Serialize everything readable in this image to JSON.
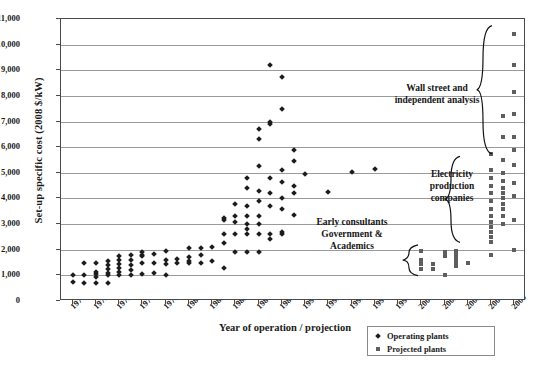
{
  "chart_data": {
    "type": "scatter",
    "title": "",
    "xlabel": "Year of operation / projection",
    "ylabel": "Set-up specific cost (2008 $/kW)",
    "xlim": [
      1970,
      2010
    ],
    "ylim": [
      0,
      11000
    ],
    "grid": true,
    "xticks": [
      1971,
      1973,
      1975,
      1977,
      1979,
      1981,
      1983,
      1985,
      1987,
      1989,
      1991,
      1993,
      1995,
      1997,
      1999,
      2001,
      2003,
      2005,
      2007,
      2009
    ],
    "yticks": [
      0,
      1000,
      2000,
      3000,
      4000,
      5000,
      6000,
      7000,
      8000,
      9000,
      10000,
      11000
    ],
    "ytick_labels": [
      "0",
      "1,000",
      "2,000",
      "3,000",
      "4,000",
      "5,000",
      "6,000",
      "7,000",
      "8,000",
      "9,000",
      "10,000",
      "11,000"
    ],
    "legend_position": "bottom-right",
    "series": [
      {
        "name": "Operating plants",
        "marker": "diamond",
        "color": "#1c1c1c",
        "points": [
          [
            1971,
            750
          ],
          [
            1971,
            1000
          ],
          [
            1972,
            700
          ],
          [
            1972,
            1000
          ],
          [
            1972,
            1500
          ],
          [
            1973,
            700
          ],
          [
            1973,
            950
          ],
          [
            1973,
            1050
          ],
          [
            1973,
            1150
          ],
          [
            1973,
            1500
          ],
          [
            1974,
            720
          ],
          [
            1974,
            1000
          ],
          [
            1974,
            1100
          ],
          [
            1974,
            1250
          ],
          [
            1974,
            1400
          ],
          [
            1974,
            1550
          ],
          [
            1975,
            1000
          ],
          [
            1975,
            1150
          ],
          [
            1975,
            1300
          ],
          [
            1975,
            1450
          ],
          [
            1975,
            1600
          ],
          [
            1975,
            1750
          ],
          [
            1976,
            1000
          ],
          [
            1976,
            1200
          ],
          [
            1976,
            1400
          ],
          [
            1976,
            1600
          ],
          [
            1976,
            1800
          ],
          [
            1977,
            1050
          ],
          [
            1977,
            1500
          ],
          [
            1977,
            1750
          ],
          [
            1977,
            1800
          ],
          [
            1977,
            1900
          ],
          [
            1978,
            1100
          ],
          [
            1978,
            1500
          ],
          [
            1978,
            1850
          ],
          [
            1979,
            1000
          ],
          [
            1979,
            1450
          ],
          [
            1979,
            1600
          ],
          [
            1979,
            1950
          ],
          [
            1980,
            1500
          ],
          [
            1980,
            1650
          ],
          [
            1981,
            1500
          ],
          [
            1981,
            1550
          ],
          [
            1981,
            1700
          ],
          [
            1981,
            2050
          ],
          [
            1982,
            1500
          ],
          [
            1982,
            1800
          ],
          [
            1982,
            2050
          ],
          [
            1983,
            1550
          ],
          [
            1983,
            2100
          ],
          [
            1984,
            1300
          ],
          [
            1984,
            2250
          ],
          [
            1984,
            2600
          ],
          [
            1984,
            3150
          ],
          [
            1984,
            3250
          ],
          [
            1985,
            1900
          ],
          [
            1985,
            2600
          ],
          [
            1985,
            3100
          ],
          [
            1985,
            3300
          ],
          [
            1985,
            3800
          ],
          [
            1986,
            1900
          ],
          [
            1986,
            2600
          ],
          [
            1986,
            2800
          ],
          [
            1986,
            3000
          ],
          [
            1986,
            3300
          ],
          [
            1986,
            3700
          ],
          [
            1986,
            4400
          ],
          [
            1986,
            4800
          ],
          [
            1987,
            1900
          ],
          [
            1987,
            2600
          ],
          [
            1987,
            3000
          ],
          [
            1987,
            3300
          ],
          [
            1987,
            3900
          ],
          [
            1987,
            4300
          ],
          [
            1987,
            5250
          ],
          [
            1987,
            6300
          ],
          [
            1987,
            6700
          ],
          [
            1988,
            2400
          ],
          [
            1988,
            2600
          ],
          [
            1988,
            3700
          ],
          [
            1988,
            4200
          ],
          [
            1988,
            4800
          ],
          [
            1988,
            6900
          ],
          [
            1988,
            7000
          ],
          [
            1988,
            9200
          ],
          [
            1989,
            2600
          ],
          [
            1989,
            2700
          ],
          [
            1989,
            3600
          ],
          [
            1989,
            4000
          ],
          [
            1989,
            4650
          ],
          [
            1989,
            5100
          ],
          [
            1989,
            7500
          ],
          [
            1989,
            8750
          ],
          [
            1990,
            3350
          ],
          [
            1990,
            4200
          ],
          [
            1990,
            4500
          ],
          [
            1990,
            5450
          ],
          [
            1990,
            5900
          ],
          [
            1991,
            4950
          ],
          [
            1993,
            4250
          ],
          [
            1995,
            5050
          ],
          [
            1997,
            5150
          ]
        ]
      },
      {
        "name": "Projected plants",
        "marker": "square",
        "color": "#5e5e5e",
        "points": [
          [
            2001,
            1950
          ],
          [
            2001,
            1600
          ],
          [
            2001,
            1450
          ],
          [
            2001,
            1250
          ],
          [
            2002,
            1450
          ],
          [
            2002,
            1250
          ],
          [
            2003,
            1900
          ],
          [
            2003,
            1750
          ],
          [
            2003,
            1000
          ],
          [
            2004,
            1950
          ],
          [
            2004,
            1800
          ],
          [
            2004,
            1650
          ],
          [
            2004,
            1500
          ],
          [
            2004,
            1350
          ],
          [
            2005,
            1500
          ],
          [
            2007,
            1800
          ],
          [
            2007,
            2300
          ],
          [
            2007,
            2500
          ],
          [
            2007,
            2700
          ],
          [
            2007,
            2900
          ],
          [
            2007,
            3100
          ],
          [
            2007,
            3300
          ],
          [
            2007,
            3600
          ],
          [
            2007,
            3900
          ],
          [
            2007,
            4200
          ],
          [
            2007,
            4500
          ],
          [
            2007,
            4800
          ],
          [
            2007,
            5100
          ],
          [
            2007,
            5750
          ],
          [
            2008,
            3000
          ],
          [
            2008,
            3300
          ],
          [
            2008,
            3600
          ],
          [
            2008,
            3800
          ],
          [
            2008,
            4000
          ],
          [
            2008,
            4200
          ],
          [
            2008,
            4400
          ],
          [
            2008,
            4700
          ],
          [
            2008,
            5000
          ],
          [
            2008,
            5500
          ],
          [
            2008,
            6400
          ],
          [
            2008,
            7200
          ],
          [
            2009,
            2000
          ],
          [
            2009,
            3150
          ],
          [
            2009,
            4100
          ],
          [
            2009,
            4600
          ],
          [
            2009,
            5300
          ],
          [
            2009,
            5900
          ],
          [
            2009,
            6400
          ],
          [
            2009,
            7300
          ],
          [
            2009,
            8150
          ],
          [
            2009,
            9200
          ],
          [
            2009,
            10400
          ]
        ]
      }
    ],
    "annotations": [
      {
        "id": "wall-street",
        "text": "Wall street and\nindependent analysis",
        "brace": "right",
        "y_range": [
          5700,
          10700
        ]
      },
      {
        "id": "electricity",
        "text": "Electricity\nproduction\ncompanies",
        "brace": "right",
        "y_range": [
          2250,
          5600
        ]
      },
      {
        "id": "early-consultants",
        "text": "Early consultants\nGovernment &\nAcademics",
        "brace": "right",
        "y_range": [
          950,
          2150
        ]
      }
    ]
  },
  "legend": {
    "items": [
      {
        "label": "Operating plants",
        "marker": "diamond"
      },
      {
        "label": "Projected plants",
        "marker": "square"
      }
    ]
  }
}
